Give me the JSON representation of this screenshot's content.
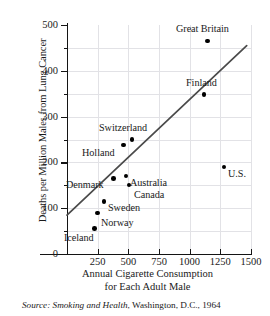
{
  "chart_data": {
    "type": "scatter",
    "title": "",
    "xlabel": "Annual Cigarette Consumption for Each Adult Male",
    "ylabel": "Deaths per Million Males from Lung Cancer",
    "xlim": [
      0,
      1500
    ],
    "ylim": [
      0,
      500
    ],
    "grid": true,
    "legend": "none",
    "xticks": [
      250,
      500,
      750,
      1000,
      1250,
      1500
    ],
    "yticks": [
      0,
      100,
      200,
      300,
      400,
      500
    ],
    "y_minor_ticks": [
      50,
      150,
      250,
      350,
      450
    ],
    "points": [
      {
        "label": "Great Britain",
        "x": 1145,
        "y": 465,
        "label_pos": "above"
      },
      {
        "label": "Finland",
        "x": 1115,
        "y": 350,
        "label_pos": "above"
      },
      {
        "label": "Switzerland",
        "x": 530,
        "y": 250,
        "label_pos": "above"
      },
      {
        "label": "Holland",
        "x": 460,
        "y": 238,
        "label_pos": "below-left"
      },
      {
        "label": "U.S.",
        "x": 1280,
        "y": 190,
        "label_pos": "right"
      },
      {
        "label": "Australia",
        "x": 480,
        "y": 170,
        "label_pos": "right"
      },
      {
        "label": "Denmark",
        "x": 380,
        "y": 165,
        "label_pos": "left"
      },
      {
        "label": "Canada",
        "x": 505,
        "y": 150,
        "label_pos": "below-right"
      },
      {
        "label": "Sweden",
        "x": 300,
        "y": 115,
        "label_pos": "right"
      },
      {
        "label": "Norway",
        "x": 250,
        "y": 90,
        "label_pos": "below-right"
      },
      {
        "label": "Iceland",
        "x": 225,
        "y": 58,
        "label_pos": "below-left"
      }
    ],
    "trend_line": {
      "x_start": 0,
      "y_start": 85,
      "x_end": 1465,
      "y_end": 455,
      "color": "#4a4a4a"
    }
  },
  "source": {
    "prefix": "Source:",
    "title": "Smoking and Health",
    "rest": ", Washington, D.C., 1964"
  },
  "x_axis_title_lines": [
    "Annual Cigarette Consumption",
    "for Each Adult Male"
  ],
  "colors": {
    "marker": "#000000",
    "axis": "#141414",
    "grid": "#e2e2e6",
    "trend": "#4a4a4a"
  }
}
